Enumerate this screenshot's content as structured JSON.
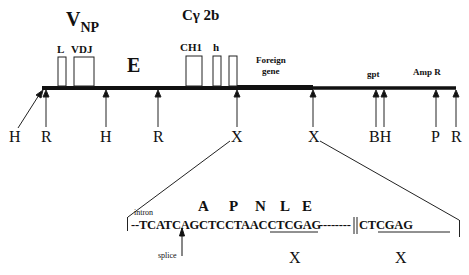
{
  "figure": {
    "type": "plasmid_construct_map",
    "upper_labels": {
      "v_region": {
        "main": "V",
        "subscript": "NP"
      },
      "c_region": "Cγ 2b",
      "enhancer": "E",
      "exons": [
        "L",
        "VDJ",
        "CH1",
        "h"
      ],
      "foreign_gene": [
        "Foreign",
        "gene"
      ],
      "gpt": "gpt",
      "amp": "Amp R"
    },
    "restriction_sites": [
      {
        "label": "H",
        "x": 15,
        "diagonal": true
      },
      {
        "label": "R",
        "x": 46
      },
      {
        "label": "H",
        "x": 106
      },
      {
        "label": "R",
        "x": 158
      },
      {
        "label": "X",
        "x": 237
      },
      {
        "label": "X",
        "x": 313
      },
      {
        "label": "BH",
        "x": 380
      },
      {
        "label": "P",
        "x": 436
      },
      {
        "label": "R",
        "x": 456
      }
    ],
    "detail": {
      "intron_label": "intron",
      "amino_acids": [
        "A",
        "P",
        "N",
        "L",
        "E"
      ],
      "sequence_left": "--TCATCAGCTCCTAACCTCGAG",
      "sequence_gap": "--------",
      "break_mark": "||",
      "sequence_right": "CTCGAG",
      "splice_label": "splice",
      "site_labels": [
        "X",
        "X"
      ]
    }
  }
}
